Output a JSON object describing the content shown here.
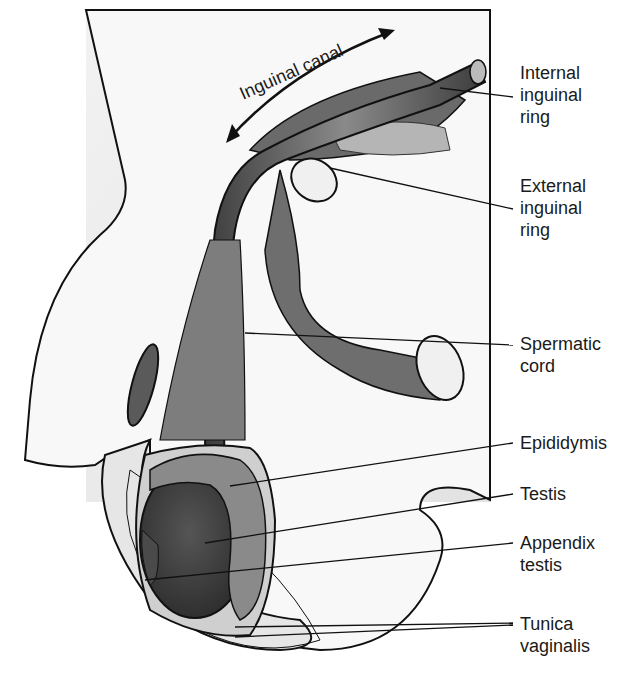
{
  "diagram": {
    "canal_label": "Inguinal canal",
    "labels": [
      {
        "id": "internal-inguinal-ring",
        "lines": [
          "Internal",
          "inguinal",
          "ring"
        ]
      },
      {
        "id": "external-inguinal-ring",
        "lines": [
          "External",
          "inguinal",
          "ring"
        ]
      },
      {
        "id": "spermatic-cord",
        "lines": [
          "Spermatic",
          "cord"
        ]
      },
      {
        "id": "epididymis",
        "lines": [
          "Epididymis"
        ]
      },
      {
        "id": "testis",
        "lines": [
          "Testis"
        ]
      },
      {
        "id": "appendix-testis",
        "lines": [
          "Appendix",
          "testis"
        ]
      },
      {
        "id": "tunica-vaginalis",
        "lines": [
          "Tunica",
          "vaginalis"
        ]
      }
    ],
    "colors": {
      "panel": "#ebebeb",
      "skin": "#f7f7f7",
      "tissue_dark": "#4a4a4a",
      "tissue_mid": "#7a7a7a",
      "testis": "#3a3a3a",
      "ink": "#111111"
    }
  }
}
